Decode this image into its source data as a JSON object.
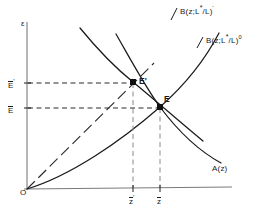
{
  "figure": {
    "type": "economics-diagram",
    "axes": {
      "y_label": "ε",
      "x_label": "",
      "origin_label": "O"
    },
    "y_ticks": [
      {
        "id": "E-prime",
        "label_base": "E",
        "label_mark": "'",
        "y_px": 83
      },
      {
        "id": "E",
        "label_base": "E",
        "label_mark": "",
        "y_px": 107
      }
    ],
    "x_ticks": [
      {
        "id": "z-bar-prime",
        "label_base": "z",
        "label_mark": "'",
        "x_px": 133
      },
      {
        "id": "z-bar",
        "label_base": "z",
        "label_mark": "",
        "x_px": 160
      }
    ],
    "curves": [
      {
        "id": "B-prime",
        "label_main": "B(z;L",
        "label_star": "*",
        "label_mid": "/L)",
        "label_sup": "'",
        "full_text": "B(z;L*/L)'"
      },
      {
        "id": "B-zero",
        "label_main": "B(z;L",
        "label_star": "*",
        "label_mid": "/L)",
        "label_sup": "0",
        "full_text": "B(z;L*/L)⁰"
      },
      {
        "id": "A",
        "label_main": "A(z)",
        "full_text": "A(z)"
      }
    ],
    "points": [
      {
        "id": "E-prime-point",
        "label": "E'",
        "x_px": 133,
        "y_px": 82
      },
      {
        "id": "E-point",
        "label": "E",
        "x_px": 160,
        "y_px": 107
      }
    ],
    "colors": {
      "ink": "#1a1a1a",
      "axis": "#6f6f6f",
      "dash": "#3a3a3a"
    }
  }
}
